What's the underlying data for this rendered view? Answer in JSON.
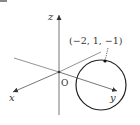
{
  "diagram": {
    "type": "3d-coordinate-axes-with-sphere",
    "axes": {
      "x_label": "x",
      "y_label": "y",
      "z_label": "z",
      "origin_label": "O"
    },
    "point": {
      "label": "(−2,  1,  −1)",
      "coords": [
        -2,
        1,
        -1
      ]
    },
    "colors": {
      "line": "#555555",
      "circle": "#222222",
      "text": "#333333"
    }
  }
}
